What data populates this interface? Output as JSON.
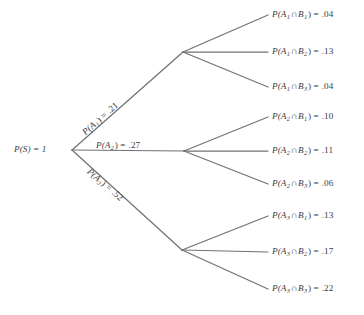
{
  "figure": {
    "type": "probability-tree-diagram",
    "background_color": "#ffffff",
    "line_color": "#6f7276",
    "text_color": "#3b3b42"
  },
  "root": {
    "label": "P(S) = 1",
    "name": "P(S)",
    "value": "1",
    "x": 72,
    "y": 150
  },
  "branches": [
    {
      "id": "A1",
      "name": "P(A",
      "sub": "1",
      "op": ") = ",
      "value": ".21",
      "label": "P(A1) = .21",
      "node_x": 183,
      "node_y": 52,
      "angle": -41.5,
      "label_x": 84,
      "label_y": 129
    },
    {
      "id": "A2",
      "name": "P(A",
      "sub": "2",
      "op": ") = ",
      "value": ".27",
      "label": "P(A2) = .27",
      "node_x": 184,
      "node_y": 151,
      "angle": 0,
      "label_x": 96,
      "label_y": 141
    },
    {
      "id": "A3",
      "name": "P(A",
      "sub": "3",
      "op": ") = ",
      "value": ".52",
      "label": "P(A3) = .52",
      "node_x": 182,
      "node_y": 250,
      "angle": 40.5,
      "label_x": 88,
      "label_y": 166
    }
  ],
  "leaves": [
    {
      "id": "A1B1",
      "pre": "P(A",
      "sub_a": "1",
      "cap": "∩",
      "preb": "B",
      "sub_b": "1",
      "op": ") = ",
      "value": ".04",
      "label": "P(A1∩B1) = .04",
      "parent": "A1",
      "x": 272,
      "y": 15
    },
    {
      "id": "A1B2",
      "pre": "P(A",
      "sub_a": "1",
      "cap": "∩",
      "preb": "B",
      "sub_b": "2",
      "op": ") = ",
      "value": ".13",
      "label": "P(A1∩B2) = .13",
      "parent": "A1",
      "x": 272,
      "y": 52
    },
    {
      "id": "A1B3",
      "pre": "P(A",
      "sub_a": "1",
      "cap": "∩",
      "preb": "B",
      "sub_b": "3",
      "op": ") = ",
      "value": ".04",
      "label": "P(A1∩B3) = .04",
      "parent": "A1",
      "x": 272,
      "y": 87
    },
    {
      "id": "A2B1",
      "pre": "P(A",
      "sub_a": "2",
      "cap": "∩",
      "preb": "B",
      "sub_b": "1",
      "op": ") = ",
      "value": ".10",
      "label": "P(A2∩B1) = .10",
      "parent": "A2",
      "x": 272,
      "y": 117
    },
    {
      "id": "A2B2",
      "pre": "P(A",
      "sub_a": "2",
      "cap": "∩",
      "preb": "B",
      "sub_b": "2",
      "op": ") = ",
      "value": ".11",
      "label": "P(A2∩B2) = .11",
      "parent": "A2",
      "x": 272,
      "y": 151
    },
    {
      "id": "A2B3",
      "pre": "P(A",
      "sub_a": "2",
      "cap": "∩",
      "preb": "B",
      "sub_b": "3",
      "op": ") = ",
      "value": ".06",
      "label": "P(A2∩B3) = .06",
      "parent": "A2",
      "x": 272,
      "y": 184
    },
    {
      "id": "A3B1",
      "pre": "P(A",
      "sub_a": "3",
      "cap": "∩",
      "preb": "B",
      "sub_b": "1",
      "op": ") = ",
      "value": ".13",
      "label": "P(A3∩B1) = .13",
      "parent": "A3",
      "x": 272,
      "y": 216
    },
    {
      "id": "A3B2",
      "pre": "P(A",
      "sub_a": "3",
      "cap": "∩",
      "preb": "B",
      "sub_b": "2",
      "op": ") = ",
      "value": ".17",
      "label": "P(A3∩B2) = .17",
      "parent": "A3",
      "x": 272,
      "y": 252
    },
    {
      "id": "A3B3",
      "pre": "P(A",
      "sub_a": "3",
      "cap": "∩",
      "preb": "B",
      "sub_b": "3",
      "op": ") = ",
      "value": ".22",
      "label": "P(A3∩B3) = .22",
      "parent": "A3",
      "x": 272,
      "y": 289
    }
  ],
  "chart_data": {
    "type": "tree",
    "title": "",
    "root_value": 1,
    "level1": {
      "labels": [
        "P(A1)",
        "P(A2)",
        "P(A3)"
      ],
      "values": [
        0.21,
        0.27,
        0.52
      ]
    },
    "level2": {
      "labels": [
        "P(A1∩B1)",
        "P(A1∩B2)",
        "P(A1∩B3)",
        "P(A2∩B1)",
        "P(A2∩B2)",
        "P(A2∩B3)",
        "P(A3∩B1)",
        "P(A3∩B2)",
        "P(A3∩B3)"
      ],
      "values": [
        0.04,
        0.13,
        0.04,
        0.1,
        0.11,
        0.06,
        0.13,
        0.17,
        0.22
      ]
    }
  }
}
